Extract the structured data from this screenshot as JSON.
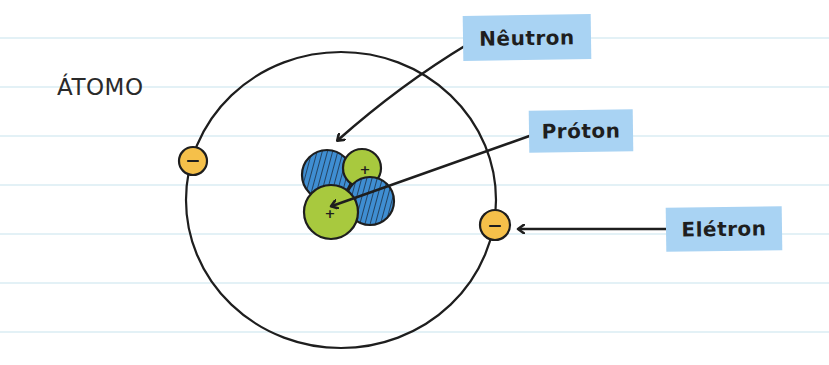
{
  "title": "ÁTOMO",
  "labels": {
    "neutron": "Nêutron",
    "proton": "Próton",
    "electron": "Elétron"
  },
  "particles": {
    "electron_charge": "−",
    "proton_charge": "+"
  },
  "colors": {
    "label_background": "#a9d3f3",
    "neutron_fill": "#3f8ed2",
    "proton_fill": "#a8c93e",
    "electron_fill": "#f5c04a",
    "ink": "#1e1e1e",
    "ruled_line": "#e3f1f6"
  }
}
